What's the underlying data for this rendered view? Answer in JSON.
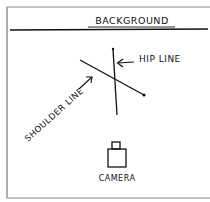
{
  "diagram": {
    "title": "BACKGROUND",
    "labels": {
      "background": "BACKGROUND",
      "hip_line": "HIP LINE",
      "shoulder_line": "SHOULDER LINE",
      "camera": "CAMERA"
    },
    "elements": [
      {
        "id": "background-line",
        "type": "line",
        "label": "BACKGROUND"
      },
      {
        "id": "hip-line",
        "type": "line",
        "label": "HIP LINE",
        "orientation": "near-vertical"
      },
      {
        "id": "shoulder-line",
        "type": "line",
        "label": "SHOULDER LINE",
        "orientation": "diagonal"
      },
      {
        "id": "camera",
        "type": "icon",
        "label": "CAMERA"
      }
    ],
    "style": {
      "stroke_color": "#111111",
      "frame_color": "#777777",
      "background_color": "#ffffff"
    }
  }
}
